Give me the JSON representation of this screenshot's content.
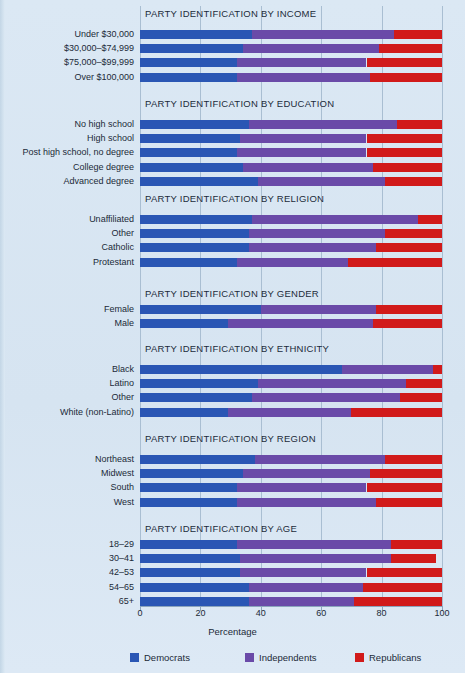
{
  "chart_data": {
    "type": "bar",
    "orientation": "horizontal",
    "stacked": true,
    "title": "",
    "xlabel": "Percentage",
    "ylabel": "",
    "xlim": [
      0,
      100
    ],
    "xticks": [
      0,
      20,
      40,
      60,
      80,
      100
    ],
    "grid": true,
    "legend_position": "bottom",
    "legend": [
      {
        "name": "Democrats",
        "color": "#2a56b4"
      },
      {
        "name": "Independents",
        "color": "#6a4aa8"
      },
      {
        "name": "Republicans",
        "color": "#d11a1a"
      }
    ],
    "series_names": [
      "Democrats",
      "Independents",
      "Republicans"
    ],
    "panels": [
      {
        "title": "PARTY IDENTIFICATION BY INCOME",
        "categories": [
          "Under $30,000",
          "$30,000–$74,999",
          "$75,000–$99,999",
          "Over $100,000"
        ],
        "values": [
          {
            "Democrats": 37,
            "Independents": 47,
            "Republicans": 16
          },
          {
            "Democrats": 34,
            "Independents": 45,
            "Republicans": 21
          },
          {
            "Democrats": 32,
            "Independents": 43,
            "Republicans": 25
          },
          {
            "Democrats": 32,
            "Independents": 44,
            "Republicans": 24
          }
        ]
      },
      {
        "title": "PARTY IDENTIFICATION BY EDUCATION",
        "categories": [
          "No high school",
          "High school",
          "Post high school, no degree",
          "College degree",
          "Advanced degree"
        ],
        "values": [
          {
            "Democrats": 36,
            "Independents": 49,
            "Republicans": 15
          },
          {
            "Democrats": 33,
            "Independents": 42,
            "Republicans": 25
          },
          {
            "Democrats": 32,
            "Independents": 43,
            "Republicans": 25
          },
          {
            "Democrats": 34,
            "Independents": 43,
            "Republicans": 23
          },
          {
            "Democrats": 39,
            "Independents": 42,
            "Republicans": 19
          }
        ]
      },
      {
        "title": "PARTY IDENTIFICATION BY RELIGION",
        "categories": [
          "Unaffiliated",
          "Other",
          "Catholic",
          "Protestant"
        ],
        "values": [
          {
            "Democrats": 37,
            "Independents": 55,
            "Republicans": 8
          },
          {
            "Democrats": 36,
            "Independents": 45,
            "Republicans": 19
          },
          {
            "Democrats": 36,
            "Independents": 42,
            "Republicans": 22
          },
          {
            "Democrats": 32,
            "Independents": 37,
            "Republicans": 31
          }
        ]
      },
      {
        "title": "PARTY IDENTIFICATION BY GENDER",
        "categories": [
          "Female",
          "Male"
        ],
        "values": [
          {
            "Democrats": 40,
            "Independents": 38,
            "Republicans": 22
          },
          {
            "Democrats": 29,
            "Independents": 48,
            "Republicans": 23
          }
        ]
      },
      {
        "title": "PARTY IDENTIFICATION BY ETHNICITY",
        "categories": [
          "Black",
          "Latino",
          "Other",
          "White (non-Latino)"
        ],
        "values": [
          {
            "Democrats": 67,
            "Independents": 30,
            "Republicans": 3
          },
          {
            "Democrats": 39,
            "Independents": 49,
            "Republicans": 12
          },
          {
            "Democrats": 37,
            "Independents": 49,
            "Republicans": 14
          },
          {
            "Democrats": 29,
            "Independents": 41,
            "Republicans": 30
          }
        ]
      },
      {
        "title": "PARTY IDENTIFICATION BY REGION",
        "categories": [
          "Northeast",
          "Midwest",
          "South",
          "West"
        ],
        "values": [
          {
            "Democrats": 38,
            "Independents": 43,
            "Republicans": 19
          },
          {
            "Democrats": 34,
            "Independents": 42,
            "Republicans": 24
          },
          {
            "Democrats": 32,
            "Independents": 43,
            "Republicans": 25
          },
          {
            "Democrats": 32,
            "Independents": 46,
            "Republicans": 22
          }
        ]
      },
      {
        "title": "PARTY IDENTIFICATION BY AGE",
        "categories": [
          "18–29",
          "30–41",
          "42–53",
          "54–65",
          "65+"
        ],
        "values": [
          {
            "Democrats": 32,
            "Independents": 51,
            "Republicans": 17
          },
          {
            "Democrats": 33,
            "Independents": 50,
            "Republicans": 15
          },
          {
            "Democrats": 33,
            "Independents": 42,
            "Republicans": 25
          },
          {
            "Democrats": 36,
            "Independents": 38,
            "Republicans": 26
          },
          {
            "Democrats": 36,
            "Independents": 35,
            "Republicans": 29
          }
        ]
      }
    ]
  }
}
